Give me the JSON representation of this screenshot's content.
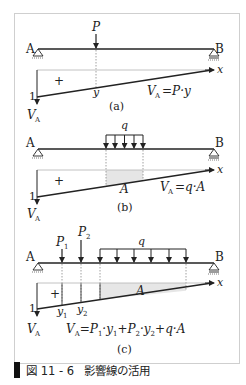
{
  "figure": {
    "caption_number": "図 11 - 6",
    "caption_title": "影響線の活用",
    "colors": {
      "line": "#222222",
      "frame": "#cfcfcf",
      "shade": "#e6e6e6",
      "dotted": "#888888"
    }
  },
  "panels": [
    {
      "id": "a",
      "label": "(a)",
      "support_left": "A",
      "support_right": "B",
      "loads": [
        {
          "type": "point",
          "name": "P"
        }
      ],
      "influence_max": "1",
      "axis_label": "x",
      "sign": "+",
      "ordinates": [
        "y"
      ],
      "reaction_label": "V",
      "reaction_sub": "A",
      "formula": "V_A = P·y",
      "formula_lhs": "V",
      "formula_sub": "A",
      "formula_rhs": "=P·y"
    },
    {
      "id": "b",
      "label": "(b)",
      "support_left": "A",
      "support_right": "B",
      "loads": [
        {
          "type": "distributed",
          "name": "q"
        }
      ],
      "influence_max": "1",
      "axis_label": "x",
      "sign": "+",
      "area_label": "A",
      "reaction_label": "V",
      "reaction_sub": "A",
      "formula": "V_A = q·A",
      "formula_lhs": "V",
      "formula_sub": "A",
      "formula_rhs": "=q·A"
    },
    {
      "id": "c",
      "label": "(c)",
      "support_left": "A",
      "support_right": "B",
      "loads": [
        {
          "type": "point",
          "name": "P",
          "sub": "1"
        },
        {
          "type": "point",
          "name": "P",
          "sub": "2"
        },
        {
          "type": "distributed",
          "name": "q"
        }
      ],
      "influence_max": "1",
      "axis_label": "x",
      "sign": "+",
      "area_label": "A",
      "ordinates": [
        {
          "name": "y",
          "sub": "1"
        },
        {
          "name": "y",
          "sub": "2"
        }
      ],
      "reaction_label": "V",
      "reaction_sub": "A",
      "formula": "V_A = P_1·y_1 + P_2·y_2 + q·A"
    }
  ]
}
